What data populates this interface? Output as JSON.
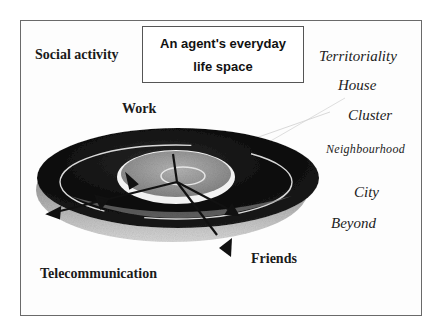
{
  "title": {
    "line1": "An agent's everyday",
    "line2": "life space"
  },
  "left_labels": {
    "social_activity": "Social activity",
    "work": "Work",
    "telecommunication": "Telecommunication",
    "friends": "Friends"
  },
  "scale_labels": [
    "Territoriality",
    "House",
    "Cluster",
    "Neighbourhood",
    "City",
    "Beyond"
  ],
  "colors": {
    "outer_disc": "#0d0d0d",
    "inner_disc": "#9a9a9a",
    "ring_highlight": "#f2f2f2",
    "arrow": "#111111",
    "frame": "#6a6a6a"
  }
}
